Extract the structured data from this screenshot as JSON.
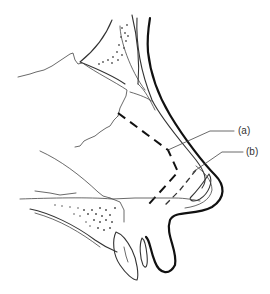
{
  "figure": {
    "labels": [
      {
        "id": "a",
        "text": "(a)",
        "x": 239,
        "y": 133
      },
      {
        "id": "b",
        "text": "(b)",
        "x": 248,
        "y": 154
      }
    ],
    "colors": {
      "background": "#ffffff",
      "line": "#111111",
      "label": "#333333"
    }
  }
}
